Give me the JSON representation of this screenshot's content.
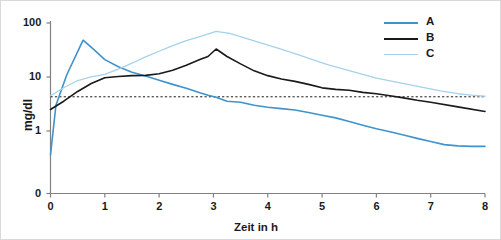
{
  "chart_data": {
    "type": "line",
    "title": "",
    "xlabel": "Zeit in h",
    "ylabel": "mg/dl",
    "yscale": "log",
    "xlim": [
      0,
      8
    ],
    "ylim": [
      0.35,
      100
    ],
    "xticks": [
      "0",
      "1",
      "2",
      "3",
      "4",
      "5",
      "6",
      "7",
      "8"
    ],
    "yticks": [
      "0",
      "1",
      "10",
      "100"
    ],
    "grid": false,
    "legend_position": "top-right",
    "reference_line": {
      "name": "threshold-line",
      "value": 4.3,
      "style": "dotted",
      "color": "#1a1a1a"
    },
    "series": [
      {
        "name": "A",
        "color": "#3f93cc",
        "x": [
          0,
          0.1,
          0.3,
          0.6,
          0.8,
          1.0,
          1.25,
          1.5,
          1.75,
          2.0,
          2.25,
          2.5,
          2.75,
          2.9,
          3.05,
          3.25,
          3.5,
          3.75,
          4.0,
          4.25,
          4.5,
          4.75,
          5.0,
          5.25,
          5.5,
          5.75,
          6.0,
          6.25,
          6.5,
          6.75,
          7.0,
          7.25,
          7.5,
          7.75,
          8.0
        ],
        "y": [
          0.36,
          3.0,
          11.0,
          48.0,
          32.0,
          21.0,
          15.5,
          12.3,
          10.4,
          8.7,
          7.3,
          6.2,
          5.1,
          4.6,
          4.2,
          3.55,
          3.4,
          3.0,
          2.75,
          2.6,
          2.45,
          2.2,
          1.95,
          1.75,
          1.5,
          1.28,
          1.1,
          0.97,
          0.84,
          0.73,
          0.64,
          0.56,
          0.53,
          0.52,
          0.52
        ]
      },
      {
        "name": "B",
        "color": "#1a1a1a",
        "x": [
          0,
          0.25,
          0.5,
          0.75,
          1.0,
          1.25,
          1.5,
          1.75,
          2.0,
          2.25,
          2.5,
          2.75,
          2.9,
          3.05,
          3.25,
          3.5,
          3.75,
          4.0,
          4.25,
          4.5,
          4.75,
          5.0,
          5.25,
          5.5,
          5.75,
          6.0,
          6.25,
          6.5,
          6.75,
          7.0,
          7.5,
          8.0
        ],
        "y": [
          2.5,
          3.6,
          5.4,
          7.6,
          9.7,
          10.2,
          10.6,
          10.7,
          11.5,
          13.3,
          16.5,
          21.0,
          24.0,
          33.0,
          24.0,
          17.5,
          13.0,
          10.6,
          9.2,
          8.3,
          7.3,
          6.3,
          5.9,
          5.7,
          5.2,
          4.9,
          4.5,
          4.1,
          3.7,
          3.4,
          2.8,
          2.3
        ]
      },
      {
        "name": "C",
        "color": "#a4d2ea",
        "x": [
          0,
          0.25,
          0.5,
          0.75,
          1.0,
          1.25,
          1.5,
          1.75,
          2.0,
          2.25,
          2.5,
          2.75,
          3.05,
          3.3,
          3.6,
          3.9,
          4.2,
          4.5,
          4.8,
          5.1,
          5.4,
          5.7,
          6.0,
          6.3,
          6.6,
          6.9,
          7.2,
          7.5,
          7.75,
          8.0
        ],
        "y": [
          4.5,
          6.4,
          8.6,
          10.1,
          11.2,
          14.0,
          18.0,
          23.5,
          30.0,
          38.0,
          47.0,
          56.0,
          70.0,
          64.0,
          52.0,
          42.0,
          34.0,
          27.0,
          21.5,
          17.0,
          14.0,
          11.6,
          9.5,
          8.3,
          7.2,
          6.3,
          5.5,
          4.9,
          4.6,
          4.4
        ]
      }
    ]
  },
  "legend": {
    "items": [
      {
        "label": "A",
        "color": "#3f93cc"
      },
      {
        "label": "B",
        "color": "#1a1a1a"
      },
      {
        "label": "C",
        "color": "#a4d2ea"
      }
    ]
  }
}
